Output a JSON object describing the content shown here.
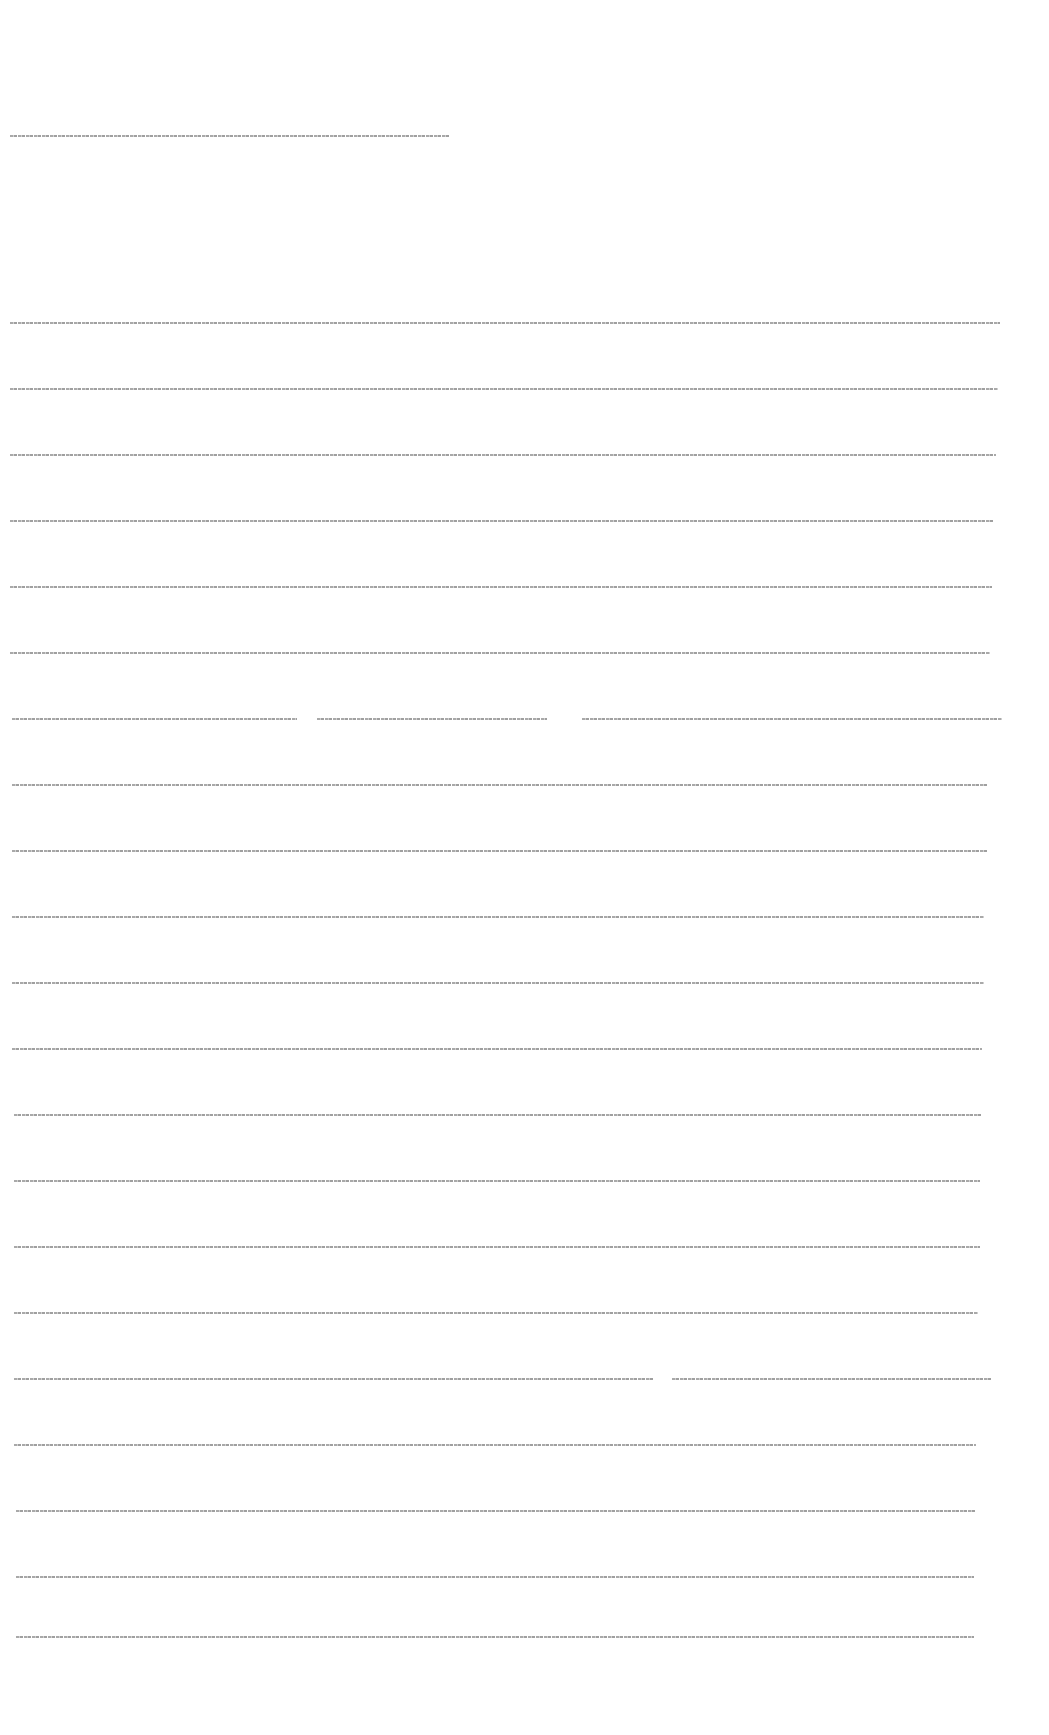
{
  "document": {
    "title_line": {
      "text": "",
      "top": 135,
      "left": 10,
      "segments": [
        440
      ]
    },
    "body_lines": [
      {
        "text": "",
        "top": 322,
        "left": 10,
        "segments": [
          990
        ]
      },
      {
        "text": "",
        "top": 388,
        "left": 10,
        "segments": [
          988
        ]
      },
      {
        "text": "",
        "top": 454,
        "left": 10,
        "segments": [
          986
        ]
      },
      {
        "text": "",
        "top": 520,
        "left": 10,
        "segments": [
          984
        ]
      },
      {
        "text": "",
        "top": 586,
        "left": 10,
        "segments": [
          982
        ]
      },
      {
        "text": "",
        "top": 652,
        "left": 10,
        "segments": [
          980
        ]
      },
      {
        "text": "",
        "top": 718,
        "left": 12,
        "segments": [
          285,
          230,
          420
        ],
        "gaps": [
          20,
          35
        ]
      },
      {
        "text": "",
        "top": 784,
        "left": 12,
        "segments": [
          976
        ]
      },
      {
        "text": "",
        "top": 850,
        "left": 12,
        "segments": [
          975
        ]
      },
      {
        "text": "",
        "top": 916,
        "left": 12,
        "segments": [
          972
        ]
      },
      {
        "text": "",
        "top": 982,
        "left": 12,
        "segments": [
          972
        ]
      },
      {
        "text": "",
        "top": 1048,
        "left": 12,
        "segments": [
          970
        ]
      },
      {
        "text": "",
        "top": 1114,
        "left": 14,
        "segments": [
          968
        ]
      },
      {
        "text": "",
        "top": 1180,
        "left": 14,
        "segments": [
          966
        ]
      },
      {
        "text": "",
        "top": 1246,
        "left": 14,
        "segments": [
          966
        ]
      },
      {
        "text": "",
        "top": 1312,
        "left": 14,
        "segments": [
          964
        ]
      },
      {
        "text": "",
        "top": 1378,
        "left": 14,
        "segments": [
          640,
          320
        ],
        "gaps": [
          18
        ]
      },
      {
        "text": "",
        "top": 1444,
        "left": 14,
        "segments": [
          962
        ]
      },
      {
        "text": "",
        "top": 1510,
        "left": 16,
        "segments": [
          960
        ]
      },
      {
        "text": "",
        "top": 1576,
        "left": 16,
        "segments": [
          958
        ]
      },
      {
        "text": "",
        "top": 1636,
        "left": 16,
        "segments": [
          958
        ]
      }
    ]
  }
}
